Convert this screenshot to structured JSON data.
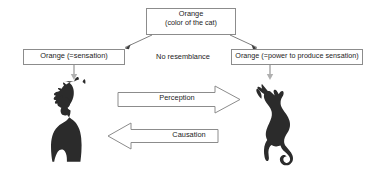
{
  "diagram": {
    "title_box": {
      "line1": "Orange",
      "line2": "(color of the cat)"
    },
    "left_box": {
      "label": "Orange (=sensation)"
    },
    "right_box": {
      "label": "Orange (=power to produce sensation)"
    },
    "middle_label": "No resemblance",
    "arrows": [
      {
        "label": "Perception",
        "direction": "right"
      },
      {
        "label": "Causation",
        "direction": "left"
      }
    ],
    "figures": [
      {
        "name": "girl-silhouette",
        "side": "left"
      },
      {
        "name": "cat-silhouette",
        "side": "right"
      }
    ],
    "colors": {
      "background": "#ffffff",
      "box_stroke": "#8c8c8c",
      "text": "#1c1c1c",
      "connector_stroke": "#a8a8a8",
      "block_arrow_stroke": "#8c8c8c",
      "silhouette_fill": "#2b2b2b"
    }
  }
}
